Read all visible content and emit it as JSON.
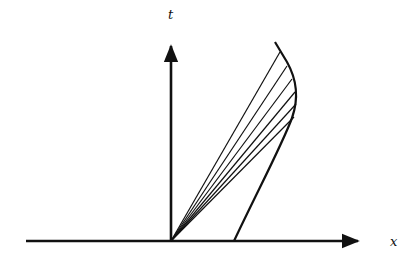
{
  "diagram": {
    "title": "",
    "axes": {
      "x_label": "x",
      "t_label": "t"
    },
    "colors": {
      "ink": "#111111",
      "background": "#ffffff"
    },
    "origin": [
      171,
      241
    ],
    "x_axis": {
      "from": [
        26,
        241
      ],
      "to": [
        360,
        241
      ]
    },
    "t_axis": {
      "from": [
        171,
        241
      ],
      "to": [
        171,
        44
      ]
    },
    "curve_points": [
      [
        234,
        241
      ],
      [
        252,
        200
      ],
      [
        270,
        160
      ],
      [
        285,
        130
      ],
      [
        294,
        110
      ],
      [
        296,
        96
      ],
      [
        293,
        80
      ],
      [
        286,
        62
      ],
      [
        275,
        42
      ]
    ],
    "fan_line_ends": [
      [
        280,
        52
      ],
      [
        287,
        66
      ],
      [
        292,
        79
      ],
      [
        295,
        92
      ],
      [
        296,
        104
      ],
      [
        294,
        117
      ]
    ]
  }
}
